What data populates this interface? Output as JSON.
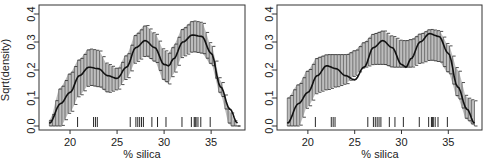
{
  "chart_data": [
    {
      "type": "line",
      "panel": "left",
      "title": "",
      "xlabel": "% silica",
      "ylabel": "Sqrt(density)",
      "xlim": [
        16.7,
        38.6
      ],
      "ylim": [
        0.0,
        0.4
      ],
      "xticks": [
        20,
        25,
        30,
        35
      ],
      "xtick_labels": [
        "20",
        "25",
        "30",
        "35"
      ],
      "yticks": [
        0.0,
        0.1,
        0.2,
        0.3,
        0.4
      ],
      "ytick_labels": [
        "0.0",
        "0.1",
        "0.2",
        "0.3",
        "0.4"
      ],
      "grid": false,
      "legend": null,
      "x": [
        17.8,
        19,
        20,
        21,
        22,
        23,
        24,
        25,
        26,
        27,
        28,
        29,
        30,
        30.5,
        31,
        32,
        33,
        34,
        35,
        36,
        37,
        37.8
      ],
      "series": [
        {
          "name": "density estimate",
          "values": [
            0.01,
            0.08,
            0.12,
            0.18,
            0.21,
            0.205,
            0.18,
            0.17,
            0.21,
            0.28,
            0.305,
            0.28,
            0.22,
            0.215,
            0.24,
            0.3,
            0.325,
            0.32,
            0.26,
            0.14,
            0.06,
            0.01
          ]
        },
        {
          "name": "upper band",
          "values": [
            0.02,
            0.14,
            0.19,
            0.24,
            0.275,
            0.27,
            0.22,
            0.205,
            0.255,
            0.33,
            0.36,
            0.33,
            0.27,
            0.26,
            0.29,
            0.35,
            0.375,
            0.37,
            0.29,
            0.16,
            0.05,
            0.0
          ]
        },
        {
          "name": "lower band",
          "values": [
            0.0,
            0.0,
            0.05,
            0.11,
            0.145,
            0.14,
            0.12,
            0.13,
            0.17,
            0.23,
            0.25,
            0.23,
            0.16,
            0.15,
            0.19,
            0.25,
            0.265,
            0.26,
            0.22,
            0.11,
            0.0,
            0.0
          ]
        }
      ],
      "rug": [
        20.8,
        22.5,
        22.7,
        22.9,
        26.4,
        27.0,
        27.2,
        27.4,
        27.6,
        27.8,
        28.7,
        29.3,
        30.2,
        31.9,
        32.9,
        33.2,
        33.3,
        33.4,
        33.6,
        33.9,
        34.9
      ]
    },
    {
      "type": "line",
      "panel": "right",
      "title": "",
      "xlabel": "% silica",
      "ylabel": "",
      "xlim": [
        16.7,
        38.6
      ],
      "ylim": [
        0.0,
        0.4
      ],
      "xticks": [
        20,
        25,
        30,
        35
      ],
      "xtick_labels": [
        "20",
        "25",
        "30",
        "35"
      ],
      "yticks": [
        0.0,
        0.1,
        0.2,
        0.3,
        0.4
      ],
      "ytick_labels": [
        "0.0",
        "0.1",
        "0.2",
        "0.3",
        "0.4"
      ],
      "grid": false,
      "legend": null,
      "x": [
        17.8,
        19,
        20,
        21,
        22,
        23,
        24,
        25,
        26,
        27,
        28,
        29,
        30,
        30.5,
        31,
        32,
        33,
        34,
        35,
        36,
        37,
        37.8
      ],
      "series": [
        {
          "name": "density estimate",
          "values": [
            0.01,
            0.08,
            0.12,
            0.18,
            0.215,
            0.205,
            0.18,
            0.165,
            0.21,
            0.28,
            0.305,
            0.28,
            0.22,
            0.21,
            0.24,
            0.3,
            0.33,
            0.32,
            0.26,
            0.14,
            0.06,
            0.01
          ]
        },
        {
          "name": "upper band",
          "values": [
            0.1,
            0.15,
            0.2,
            0.245,
            0.255,
            0.255,
            0.255,
            0.27,
            0.3,
            0.33,
            0.34,
            0.32,
            0.305,
            0.305,
            0.31,
            0.33,
            0.345,
            0.34,
            0.29,
            0.2,
            0.1,
            0.09
          ]
        },
        {
          "name": "lower band",
          "values": [
            0.0,
            0.0,
            0.07,
            0.12,
            0.13,
            0.14,
            0.15,
            0.18,
            0.21,
            0.22,
            0.22,
            0.21,
            0.21,
            0.21,
            0.21,
            0.225,
            0.235,
            0.23,
            0.19,
            0.1,
            0.02,
            0.0
          ]
        }
      ],
      "rug": [
        20.8,
        22.5,
        22.7,
        22.9,
        26.4,
        27.0,
        27.2,
        27.4,
        27.6,
        27.8,
        28.7,
        29.3,
        30.2,
        31.9,
        32.9,
        33.2,
        33.3,
        33.4,
        33.6,
        33.9,
        34.9
      ]
    }
  ],
  "panels": [
    {
      "xlabel": "% silica",
      "ylabel": "Sqrt(density)"
    },
    {
      "xlabel": "% silica",
      "ylabel": ""
    }
  ],
  "style": {
    "band_fill": "#bdbdbd",
    "line_color": "#111111",
    "frame_color": "#333333"
  }
}
